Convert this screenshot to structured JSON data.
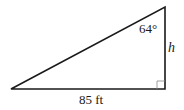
{
  "diagram": {
    "type": "right-triangle",
    "angle_label": "64°",
    "side_vertical_label": "h",
    "side_base_label": "85 ft",
    "colors": {
      "stroke": "#1a1a1a",
      "right_angle_box": "#888888",
      "background": "#ffffff"
    }
  }
}
